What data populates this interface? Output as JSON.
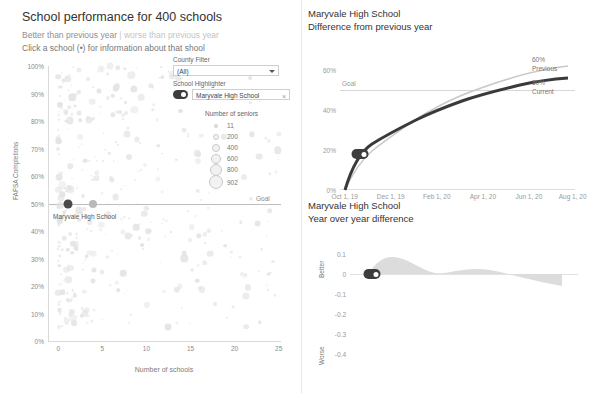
{
  "left": {
    "title": "School performance for 400 schools",
    "subtitle_better": "Better than previous year",
    "subtitle_sep": "|",
    "subtitle_worse": "worse than previous year",
    "instruction": "Click a school (•) for information about that shool",
    "y_axis_title": "FAFSA Completions",
    "x_axis_title": "Number of schools",
    "goal_label": "Goal",
    "highlight_callout": "Maryvale High School",
    "y_ticks": [
      "100%",
      "90%",
      "80%",
      "70%",
      "60%",
      "50%",
      "40%",
      "30%",
      "20%",
      "10%",
      "0%"
    ],
    "x_ticks": [
      "0",
      "5",
      "10",
      "15",
      "20",
      "25"
    ],
    "county_filter": {
      "label": "County Filter",
      "value": "(All)"
    },
    "school_highlighter": {
      "label": "School Highlighter",
      "value": "Maryvale High School",
      "clear": "×"
    },
    "size_legend": {
      "title": "Number of seniors",
      "items": [
        {
          "label": "11",
          "size": 2
        },
        {
          "label": "200",
          "size": 4
        },
        {
          "label": "400",
          "size": 6
        },
        {
          "label": "600",
          "size": 8
        },
        {
          "label": "800",
          "size": 10
        },
        {
          "label": "902",
          "size": 12
        }
      ]
    }
  },
  "right_top": {
    "title": "Maryvale High School",
    "subtitle": "Difference from previous year",
    "goal_label": "Goal",
    "y_ticks": [
      "60%",
      "40%",
      "20%",
      "0%"
    ],
    "x_ticks": [
      "Oct 1, 19",
      "Dec 1, 19",
      "Feb 1, 20",
      "Apr 1, 20",
      "Jun 1, 20",
      "Aug 1, 20"
    ],
    "annotations": [
      {
        "label": "60%"
      },
      {
        "label": "Previous"
      },
      {
        "label": "50%"
      },
      {
        "label": "Current"
      }
    ]
  },
  "right_bottom": {
    "title": "Maryvale High School",
    "subtitle": "Year over year difference",
    "y_ticks": [
      "0.1",
      "0",
      "-0.1",
      "-0.2",
      "-0.3",
      "-0.4"
    ],
    "axis_label_top": "Better",
    "axis_label_bottom": "Worse"
  },
  "chart_data": [
    {
      "type": "scatter",
      "title": "School performance for 400 schools",
      "xlabel": "Number of schools",
      "ylabel": "FAFSA Completions",
      "xlim": [
        0,
        26
      ],
      "ylim": [
        0,
        1
      ],
      "grid": false,
      "size_field": "Number of seniors",
      "size_legend_values": [
        11,
        200,
        400,
        600,
        800,
        902
      ],
      "goal_y": 0.5,
      "highlighted_points": [
        {
          "label": "Maryvale High School",
          "x": 0.9,
          "y": 0.5,
          "size": 902,
          "color": "#4a4a4a"
        },
        {
          "label": "",
          "x": 2.1,
          "y": 0.5,
          "size": 600,
          "color": "#b9b9b9"
        }
      ],
      "note": "cloud of ~400 light grey bubbles spread x 0..25, y 0.05..1.0, densest near x<8"
    },
    {
      "type": "line",
      "title": "Maryvale High School",
      "subtitle": "Difference from previous year",
      "xlabel": "",
      "ylabel": "",
      "xlim": [
        "Oct 1, 19",
        "Aug 1, 20"
      ],
      "ylim": [
        0,
        0.68
      ],
      "yticks": [
        0,
        0.2,
        0.4,
        0.6
      ],
      "goal_y": 0.5,
      "x": [
        "Oct 1, 19",
        "Nov 1, 19",
        "Dec 1, 19",
        "Jan 1, 20",
        "Feb 1, 20",
        "Mar 1, 20",
        "Apr 1, 20",
        "May 1, 20",
        "Jun 1, 20",
        "Jul 1, 20",
        "Aug 1, 20"
      ],
      "series": [
        {
          "name": "Current",
          "color": "#3d3d3d",
          "values": [
            0.0,
            0.21,
            0.3,
            0.36,
            0.4,
            0.43,
            0.455,
            0.47,
            0.485,
            0.5,
            0.505
          ]
        },
        {
          "name": "Previous",
          "color": "#c9c9c9",
          "values": [
            0.0,
            0.15,
            0.25,
            0.33,
            0.39,
            0.435,
            0.465,
            0.5,
            0.545,
            0.585,
            0.6
          ]
        }
      ],
      "annotations": [
        {
          "text": "60%",
          "series": "Previous"
        },
        {
          "text": "Previous",
          "series": "Previous"
        },
        {
          "text": "50%",
          "series": "Current"
        },
        {
          "text": "Current",
          "series": "Current"
        },
        {
          "text": "Goal",
          "y": 0.5
        }
      ]
    },
    {
      "type": "area",
      "title": "Maryvale High School",
      "subtitle": "Year over year difference",
      "xlabel": "",
      "ylabel": "",
      "ylim": [
        -0.45,
        0.15
      ],
      "yticks": [
        0.1,
        0,
        -0.1,
        -0.2,
        -0.3,
        -0.4
      ],
      "axis_note_top": "Better",
      "axis_note_bottom": "Worse",
      "x": [
        "Oct 1, 19",
        "Nov 1, 19",
        "Dec 1, 19",
        "Jan 1, 20",
        "Feb 1, 20",
        "Mar 1, 20",
        "Apr 1, 20",
        "May 1, 20",
        "Jun 1, 20",
        "Jul 1, 20",
        "Aug 1, 20"
      ],
      "values": [
        0.0,
        0.06,
        0.05,
        0.03,
        0.012,
        -0.005,
        -0.01,
        -0.008,
        -0.02,
        -0.06,
        -0.095
      ],
      "color": "#d8d8d8"
    }
  ]
}
